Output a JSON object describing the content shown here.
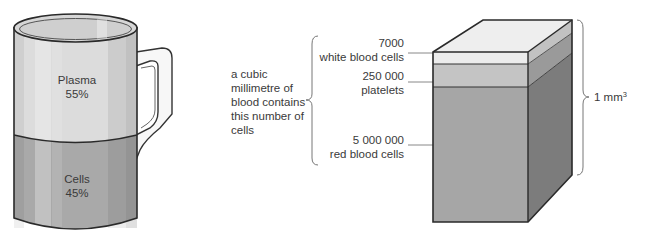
{
  "mug": {
    "plasma_label": "Plasma",
    "plasma_percent": "55%",
    "cells_label": "Cells",
    "cells_percent": "45%",
    "colors": {
      "plasma": "#dcdcdc",
      "cells": "#a9a9a9",
      "outline": "#2a2a2a"
    }
  },
  "description": {
    "lines": [
      "a cubic",
      "millimetre of",
      "blood contains",
      "this number of",
      "cells"
    ]
  },
  "counts": [
    {
      "value": "7000",
      "label": "white blood cells"
    },
    {
      "value": "250 000",
      "label": "platelets"
    },
    {
      "value": "5 000 000",
      "label": "red blood cells"
    }
  ],
  "cube": {
    "volume_label": "1 mm",
    "volume_exponent": "3",
    "colors": {
      "white_cells": "#ececec",
      "platelets": "#c4c4c4",
      "red_cells": "#a6a6a6",
      "side_dark": "#7c7c7c"
    }
  }
}
